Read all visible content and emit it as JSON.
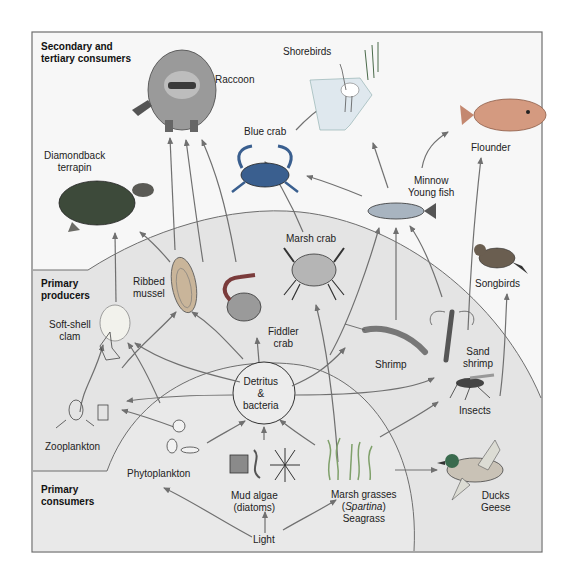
{
  "diagram": {
    "zones": {
      "secondary_tertiary": {
        "line1": "Secondary and",
        "line2": "tertiary consumers"
      },
      "primary_producers": {
        "line1": "Primary",
        "line2": "producers"
      },
      "primary_consumers": {
        "line1": "Primary",
        "line2": "consumers"
      }
    },
    "nodes": {
      "raccoon": "Raccoon",
      "shorebirds": "Shorebirds",
      "blue_crab": "Blue crab",
      "flounder": "Flounder",
      "terrapin_1": "Diamondback",
      "terrapin_2": "terrapin",
      "minnow_1": "Minnow",
      "minnow_2": "Young fish",
      "marsh_crab": "Marsh crab",
      "ribbed_mussel_1": "Ribbed",
      "ribbed_mussel_2": "mussel",
      "soft_shell_1": "Soft-shell",
      "soft_shell_2": "clam",
      "fiddler_1": "Fiddler",
      "fiddler_2": "crab",
      "songbirds": "Songbirds",
      "shrimp": "Shrimp",
      "sand_shrimp_1": "Sand",
      "sand_shrimp_2": "shrimp",
      "detritus_1": "Detritus",
      "detritus_2": "&",
      "detritus_3": "bacteria",
      "insects": "Insects",
      "zooplankton": "Zooplankton",
      "phytoplankton": "Phytoplankton",
      "mud_algae_1": "Mud algae",
      "mud_algae_2": "(diatoms)",
      "marsh_grass_1": "Marsh grasses",
      "marsh_grass_2a": "(",
      "marsh_grass_2b": "Spartina",
      "marsh_grass_2c": ")",
      "marsh_grass_3": "Seagrass",
      "ducks_1": "Ducks",
      "ducks_2": "Geese",
      "light": "Light"
    },
    "colors": {
      "frame_border": "#6e6e6e",
      "upper_bg": "#f7f7f7",
      "middle_bg": "#e4e4e4",
      "lower_bg": "#e9e9e9",
      "arrow": "#707070",
      "blue_crab": "#3a5f8f",
      "terrapin": "#3d4a3a",
      "raccoon": "#8c8c8c",
      "flounder": "#d49a80",
      "duck_head": "#3a6b4e",
      "fish": "#a8b4c0",
      "fiddler": "#7a3b3b",
      "grass": "#7fa06a"
    }
  }
}
